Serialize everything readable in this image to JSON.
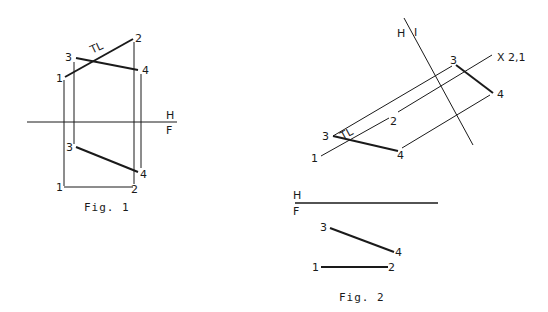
{
  "figures": [
    {
      "caption": "Fig. 1",
      "fold_line": {
        "upper": "H",
        "lower": "F"
      },
      "true_length_label": "TL",
      "top_view_points": {
        "p1": "1",
        "p2": "2",
        "p3": "3",
        "p4": "4"
      },
      "front_view_points": {
        "p1": "1",
        "p2": "2",
        "p3": "3",
        "p4": "4"
      }
    },
    {
      "caption": "Fig. 2",
      "aux_fold_line": {
        "left": "H",
        "right": "I"
      },
      "point_view_label": "X 2,1",
      "true_length_label": "TL",
      "fold_line": {
        "upper": "H",
        "lower": "F"
      },
      "top_view_points": {
        "p1": "1",
        "p2": "2",
        "p3": "3",
        "p4": "4"
      },
      "aux_view_points": {
        "p3": "3",
        "p4": "4"
      },
      "front_view_points": {
        "p1": "1",
        "p2": "2",
        "p3": "3",
        "p4": "4"
      }
    }
  ],
  "colors": {
    "ink": "#1a1a1a",
    "background": "#ffffff"
  }
}
